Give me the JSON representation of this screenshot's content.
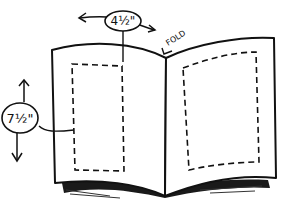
{
  "diagram": {
    "type": "illustration",
    "labels": {
      "width": "4½\"",
      "height": "7½\"",
      "fold": "FOLD"
    },
    "colors": {
      "line": "#111111",
      "paper": "#ffffff",
      "shadow": "#1a1a1a"
    }
  }
}
